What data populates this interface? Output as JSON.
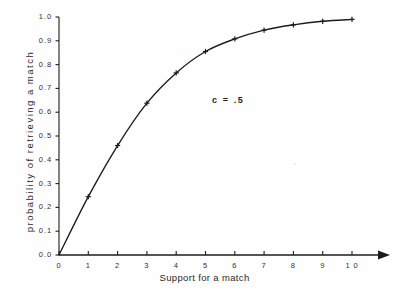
{
  "chart_data": {
    "type": "line",
    "title": "",
    "xlabel": "Support for a match",
    "ylabel": "probability of retrieving a match",
    "xlim": [
      0,
      10
    ],
    "ylim": [
      0,
      1.0
    ],
    "grid": false,
    "legend": null,
    "annotations": [
      {
        "text": "c = .5",
        "x": 5.2,
        "y": 0.69
      }
    ],
    "xticks": [
      "0",
      "1",
      "2",
      "3",
      "4",
      "5",
      "6",
      "7",
      "8",
      "9",
      "1 0"
    ],
    "xtick_values": [
      0,
      1,
      2,
      3,
      4,
      5,
      6,
      7,
      8,
      9,
      10
    ],
    "yticks": [
      "0.0",
      "0.1",
      "0.2",
      "0.3",
      "0.4",
      "0.5",
      "0.6",
      "0.7",
      "0.8",
      "0.9",
      "1.0"
    ],
    "ytick_values": [
      0.0,
      0.1,
      0.2,
      0.3,
      0.4,
      0.5,
      0.6,
      0.7,
      0.8,
      0.9,
      1.0
    ],
    "series": [
      {
        "name": "c = .5",
        "marker": "cross",
        "color": "#1c1c1c",
        "x": [
          0,
          1,
          2,
          3,
          4,
          5,
          6,
          7,
          8,
          9,
          10
        ],
        "values": [
          0.0,
          0.245,
          0.46,
          0.638,
          0.765,
          0.855,
          0.908,
          0.945,
          0.967,
          0.982,
          0.99
        ]
      }
    ]
  },
  "axes": {
    "x_arrow": true,
    "y_arrow": false,
    "axis_color": "#1c1c1c"
  }
}
